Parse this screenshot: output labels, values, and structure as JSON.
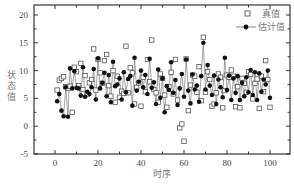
{
  "chart_data": {
    "type": "line",
    "title": "",
    "xlabel": "时序",
    "ylabel": "状态值",
    "xlim": [
      -8,
      108
    ],
    "ylim": [
      -5,
      22
    ],
    "xticks": [
      0,
      20,
      40,
      60,
      80,
      100
    ],
    "xtick_labels": [
      "0",
      "20",
      "40",
      "60",
      "80",
      "100"
    ],
    "yticks": [
      -5,
      0,
      5,
      10,
      15,
      20
    ],
    "ytick_labels": [
      "-5",
      "0",
      "5",
      "10",
      "15",
      "20"
    ],
    "grid": false,
    "legend_position": "upper right",
    "series": [
      {
        "name": "真值",
        "style": "open-square markers",
        "x": [
          1,
          2,
          3,
          4,
          5,
          6,
          7,
          8,
          9,
          10,
          11,
          12,
          13,
          14,
          15,
          16,
          17,
          18,
          19,
          20,
          21,
          22,
          23,
          24,
          25,
          26,
          27,
          28,
          29,
          30,
          31,
          32,
          33,
          34,
          35,
          36,
          37,
          38,
          39,
          40,
          41,
          42,
          43,
          44,
          45,
          46,
          47,
          48,
          49,
          50,
          51,
          52,
          53,
          54,
          55,
          56,
          57,
          58,
          59,
          60,
          61,
          62,
          63,
          64,
          65,
          66,
          67,
          68,
          69,
          70,
          71,
          72,
          73,
          74,
          75,
          76,
          77,
          78,
          79,
          80,
          81,
          82,
          83,
          84,
          85,
          86,
          87,
          88,
          89,
          90,
          91,
          92,
          93,
          94,
          95,
          96,
          97,
          98,
          99,
          100
        ],
        "y": [
          6.5,
          8.3,
          8.6,
          8.9,
          7.1,
          6.8,
          7.2,
          2.5,
          10.6,
          9.8,
          7.3,
          11.3,
          6.6,
          9.1,
          5.7,
          7.8,
          8.4,
          13.9,
          6.5,
          12.0,
          9.6,
          7.7,
          11.8,
          12.9,
          7.3,
          5.4,
          10.0,
          4.3,
          9.0,
          5.2,
          6.3,
          5.9,
          14.4,
          6.0,
          10.5,
          9.6,
          4.0,
          7.0,
          7.8,
          3.6,
          8.8,
          6.2,
          12.0,
          8.0,
          15.5,
          6.6,
          6.0,
          4.3,
          9.4,
          8.6,
          5.6,
          3.4,
          7.1,
          9.7,
          5.8,
          12.0,
          4.7,
          -0.3,
          0.4,
          -2.7,
          12.1,
          2.8,
          7.4,
          9.2,
          9.0,
          6.1,
          10.7,
          4.6,
          16.0,
          6.1,
          9.8,
          8.4,
          3.6,
          4.0,
          6.0,
          9.4,
          8.8,
          3.3,
          6.4,
          9.2,
          8.8,
          10.1,
          9.0,
          3.5,
          7.1,
          3.3,
          8.6,
          7.7,
          6.1,
          9.8,
          9.3,
          4.9,
          7.7,
          8.5,
          3.2,
          9.0,
          6.2,
          11.8,
          8.4,
          3.4
        ]
      },
      {
        "name": "估计值",
        "style": "filled circle markers with line",
        "x": [
          1,
          2,
          3,
          4,
          5,
          6,
          7,
          8,
          9,
          10,
          11,
          12,
          13,
          14,
          15,
          16,
          17,
          18,
          19,
          20,
          21,
          22,
          23,
          24,
          25,
          26,
          27,
          28,
          29,
          30,
          31,
          32,
          33,
          34,
          35,
          36,
          37,
          38,
          39,
          40,
          41,
          42,
          43,
          44,
          45,
          46,
          47,
          48,
          49,
          50,
          51,
          52,
          53,
          54,
          55,
          56,
          57,
          58,
          59,
          60,
          61,
          62,
          63,
          64,
          65,
          66,
          67,
          68,
          69,
          70,
          71,
          72,
          73,
          74,
          75,
          76,
          77,
          78,
          79,
          80,
          81,
          82,
          83,
          84,
          85,
          86,
          87,
          88,
          89,
          90,
          91,
          92,
          93,
          94,
          95,
          96,
          97,
          98,
          99,
          100
        ],
        "y": [
          4.5,
          5.8,
          2.8,
          1.8,
          7.0,
          1.7,
          10.4,
          6.8,
          9.9,
          6.9,
          6.8,
          5.5,
          10.6,
          5.3,
          6.2,
          5.8,
          7.0,
          10.3,
          4.8,
          12.2,
          6.8,
          7.8,
          9.6,
          5.4,
          9.2,
          4.3,
          11.6,
          7.2,
          7.5,
          8.6,
          4.8,
          9.7,
          6.1,
          8.5,
          9.0,
          3.7,
          12.3,
          6.4,
          8.0,
          10.0,
          7.0,
          9.2,
          5.8,
          12.1,
          6.9,
          7.9,
          4.0,
          10.2,
          5.1,
          8.6,
          2.5,
          7.2,
          6.5,
          11.5,
          6.0,
          8.3,
          3.8,
          6.8,
          9.4,
          5.3,
          12.0,
          6.4,
          4.1,
          9.3,
          6.6,
          7.3,
          4.4,
          9.0,
          15.0,
          6.6,
          11.0,
          7.3,
          5.6,
          9.1,
          4.0,
          8.4,
          7.0,
          5.2,
          12.3,
          6.5,
          9.1,
          4.7,
          8.6,
          6.0,
          9.0,
          4.7,
          7.8,
          5.4,
          8.8,
          6.1,
          10.1,
          5.6,
          9.7,
          4.7,
          9.5,
          6.2,
          8.4,
          7.5,
          10.0,
          5.1
        ]
      }
    ]
  },
  "legend": {
    "items": [
      {
        "label": "真值",
        "marker": "open-square"
      },
      {
        "label": "估计值",
        "marker": "filled-circle-line"
      }
    ]
  },
  "axes": {
    "x_title": "时序",
    "y_title": "状态值"
  },
  "colors": {
    "frame": "#222222",
    "true_marker": "#555555",
    "estimate_marker": "#111111",
    "estimate_line": "#666666",
    "text": "#777777"
  }
}
